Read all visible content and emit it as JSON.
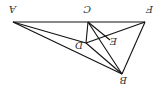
{
  "diagram": {
    "type": "geometry",
    "rotation_deg": 180,
    "points": {
      "A": {
        "label": "A",
        "x": 13,
        "y": 22,
        "lx": 10,
        "ly": 13
      },
      "C": {
        "label": "C",
        "x": 88,
        "y": 22,
        "lx": 86,
        "ly": 13
      },
      "F": {
        "label": "F",
        "x": 145,
        "y": 22,
        "lx": 147,
        "ly": 13
      },
      "D": {
        "label": "D",
        "x": 86,
        "y": 43,
        "lx": 78,
        "ly": 50
      },
      "E": {
        "label": "E",
        "x": 102,
        "y": 38,
        "lx": 112,
        "ly": 46
      },
      "B": {
        "label": "B",
        "x": 122,
        "y": 74,
        "lx": 122,
        "ly": 85
      }
    },
    "segments": [
      [
        "A",
        "F"
      ],
      [
        "A",
        "D"
      ],
      [
        "A",
        "B"
      ],
      [
        "D",
        "B"
      ],
      [
        "C",
        "D"
      ],
      [
        "C",
        "B"
      ],
      [
        "D",
        "F"
      ],
      [
        "F",
        "B"
      ],
      [
        "C",
        "E"
      ],
      [
        "E",
        "B"
      ]
    ]
  }
}
